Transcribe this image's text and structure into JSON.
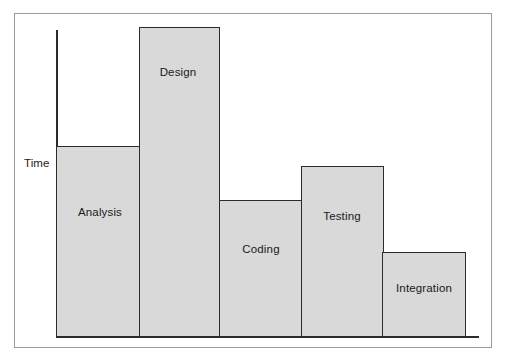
{
  "figure": {
    "border_color": "#9a9a9a",
    "background": "#ffffff"
  },
  "axes": {
    "y_axis_title": "Time",
    "axis_color": "#2b2b2b"
  },
  "chart_data": {
    "type": "bar",
    "title": "",
    "subtitle": "",
    "xlabel": "",
    "ylabel": "Time",
    "categories": [
      "Analysis",
      "Design",
      "Coding",
      "Testing",
      "Integration"
    ],
    "values": [
      190,
      310,
      137,
      170,
      85
    ],
    "value_unit": "relative time (pixels of bar height)",
    "ylim": [
      0,
      310
    ],
    "grid": false,
    "legend": null,
    "annotations": [
      "Bar labels are drawn inside each bar",
      "Y axis is unlabeled/unscaled, representing relative Time"
    ],
    "bar_fill_color": "#d9d9d9",
    "bar_edge_color": "#2b2b2b",
    "bars": [
      {
        "label": "Analysis",
        "x": 56,
        "y": 146,
        "width": 84,
        "height": 191
      },
      {
        "label": "Design",
        "x": 139,
        "y": 27,
        "width": 81,
        "height": 310
      },
      {
        "label": "Coding",
        "x": 219,
        "y": 200,
        "width": 84,
        "height": 137
      },
      {
        "label": "Testing",
        "x": 301,
        "y": 166,
        "width": 83,
        "height": 171
      },
      {
        "label": "Integration",
        "x": 382,
        "y": 252,
        "width": 84,
        "height": 85
      }
    ],
    "label_positions": [
      {
        "label": "Analysis",
        "cx": 100,
        "cy": 212
      },
      {
        "label": "Design",
        "cx": 178,
        "cy": 72
      },
      {
        "label": "Coding",
        "cx": 261,
        "cy": 249
      },
      {
        "label": "Testing",
        "cx": 342,
        "cy": 216
      },
      {
        "label": "Integration",
        "cx": 424,
        "cy": 288
      }
    ]
  }
}
